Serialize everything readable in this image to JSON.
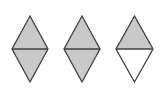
{
  "figure": {
    "label": ")",
    "colors": {
      "shaded": "#c9c9c9",
      "unshaded": "#ffffff",
      "stroke": "#3f3f3f"
    },
    "shapes": [
      {
        "id": "rhombus-1",
        "cx": 30,
        "top": 16,
        "mid": 49,
        "bottom": 82,
        "half_width": 18,
        "top_shaded": true,
        "bottom_shaded": true
      },
      {
        "id": "rhombus-2",
        "cx": 82,
        "top": 16,
        "mid": 49,
        "bottom": 82,
        "half_width": 18,
        "top_shaded": true,
        "bottom_shaded": true
      },
      {
        "id": "rhombus-3",
        "cx": 134.5,
        "top": 16,
        "mid": 49,
        "bottom": 82,
        "half_width": 18.5,
        "top_shaded": true,
        "bottom_shaded": false
      }
    ],
    "shaded_parts": 5,
    "total_parts": 6
  }
}
